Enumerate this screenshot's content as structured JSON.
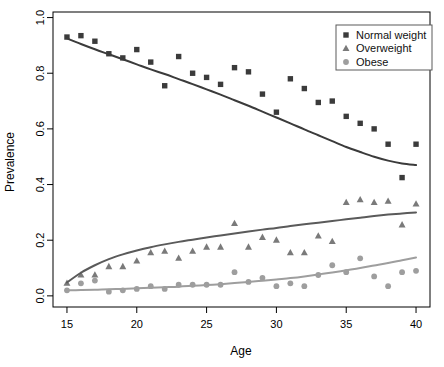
{
  "chart_data": {
    "type": "scatter",
    "title": "",
    "xlabel": "Age",
    "ylabel": "Prevalence",
    "xlim": [
      14.0,
      41.0
    ],
    "ylim": [
      -0.04,
      1.02
    ],
    "xticks": [
      15,
      20,
      25,
      30,
      35,
      40
    ],
    "xtick_labels": [
      "15",
      "20",
      "25",
      "30",
      "35",
      "40"
    ],
    "yticks": [
      0.0,
      0.2,
      0.4,
      0.6,
      0.8,
      1.0
    ],
    "ytick_labels": [
      "0.0",
      "0.2",
      "0.4",
      "0.6",
      "0.8",
      "1.0"
    ],
    "grid": false,
    "legend_position": "top-right",
    "series": [
      {
        "name": "Normal weight",
        "marker": "square",
        "color": "#3b3b3b",
        "line_color": "#3b3b3b",
        "x": [
          15,
          16,
          17,
          18,
          19,
          20,
          21,
          22,
          23,
          24,
          25,
          26,
          27,
          28,
          29,
          30,
          31,
          32,
          33,
          34,
          35,
          36,
          37,
          38,
          39,
          40
        ],
        "y": [
          0.93,
          0.935,
          0.915,
          0.87,
          0.855,
          0.885,
          0.84,
          0.755,
          0.86,
          0.8,
          0.785,
          0.76,
          0.82,
          0.805,
          0.725,
          0.66,
          0.78,
          0.745,
          0.695,
          0.7,
          0.645,
          0.62,
          0.6,
          0.545,
          0.425,
          0.545
        ],
        "fit_x": [
          15,
          16,
          17,
          18,
          19,
          20,
          21,
          22,
          23,
          24,
          25,
          26,
          27,
          28,
          29,
          30,
          31,
          32,
          33,
          34,
          35,
          36,
          37,
          38,
          39,
          40
        ],
        "fit_y": [
          0.925,
          0.905,
          0.886,
          0.868,
          0.85,
          0.832,
          0.814,
          0.797,
          0.779,
          0.761,
          0.742,
          0.723,
          0.703,
          0.683,
          0.662,
          0.641,
          0.62,
          0.598,
          0.577,
          0.556,
          0.535,
          0.517,
          0.5,
          0.486,
          0.476,
          0.47
        ]
      },
      {
        "name": "Overweight",
        "marker": "triangle",
        "color": "#7a7a7a",
        "line_color": "#5a5a5a",
        "x": [
          15,
          16,
          17,
          18,
          19,
          20,
          21,
          22,
          23,
          24,
          25,
          26,
          27,
          28,
          29,
          30,
          31,
          32,
          33,
          34,
          35,
          36,
          37,
          38,
          39,
          40
        ],
        "y": [
          0.045,
          0.075,
          0.075,
          0.105,
          0.105,
          0.125,
          0.155,
          0.16,
          0.135,
          0.16,
          0.175,
          0.175,
          0.26,
          0.175,
          0.21,
          0.2,
          0.155,
          0.155,
          0.215,
          0.195,
          0.335,
          0.345,
          0.335,
          0.34,
          0.255,
          0.33
        ],
        "fit_x": [
          15,
          16,
          17,
          18,
          19,
          20,
          21,
          22,
          23,
          24,
          25,
          26,
          27,
          28,
          29,
          30,
          31,
          32,
          33,
          34,
          35,
          36,
          37,
          38,
          39,
          40
        ],
        "fit_y": [
          0.048,
          0.083,
          0.11,
          0.132,
          0.149,
          0.163,
          0.175,
          0.185,
          0.194,
          0.202,
          0.21,
          0.217,
          0.224,
          0.231,
          0.238,
          0.244,
          0.251,
          0.257,
          0.263,
          0.269,
          0.275,
          0.281,
          0.287,
          0.292,
          0.296,
          0.3
        ]
      },
      {
        "name": "Obese",
        "marker": "circle",
        "color": "#9e9e9e",
        "line_color": "#9e9e9e",
        "x": [
          15,
          16,
          17,
          18,
          19,
          20,
          21,
          22,
          23,
          24,
          25,
          26,
          27,
          28,
          29,
          30,
          31,
          32,
          33,
          34,
          35,
          36,
          37,
          38,
          39,
          40
        ],
        "y": [
          0.02,
          0.045,
          0.055,
          0.015,
          0.02,
          0.025,
          0.035,
          0.025,
          0.04,
          0.04,
          0.04,
          0.04,
          0.085,
          0.05,
          0.065,
          0.035,
          0.045,
          0.035,
          0.075,
          0.11,
          0.085,
          0.135,
          0.07,
          0.035,
          0.085,
          0.09
        ],
        "fit_x": [
          15,
          16,
          17,
          18,
          19,
          20,
          21,
          22,
          23,
          24,
          25,
          26,
          27,
          28,
          29,
          30,
          31,
          32,
          33,
          34,
          35,
          36,
          37,
          38,
          39,
          40
        ],
        "fit_y": [
          0.02,
          0.021,
          0.022,
          0.024,
          0.025,
          0.027,
          0.029,
          0.031,
          0.033,
          0.036,
          0.039,
          0.042,
          0.046,
          0.05,
          0.054,
          0.059,
          0.064,
          0.07,
          0.077,
          0.084,
          0.092,
          0.1,
          0.109,
          0.118,
          0.128,
          0.138
        ]
      }
    ]
  },
  "legend": {
    "entries": [
      {
        "label": "Normal weight",
        "marker": "square",
        "color": "#3b3b3b"
      },
      {
        "label": "Overweight",
        "marker": "triangle",
        "color": "#7a7a7a"
      },
      {
        "label": "Obese",
        "marker": "circle",
        "color": "#9e9e9e"
      }
    ]
  }
}
